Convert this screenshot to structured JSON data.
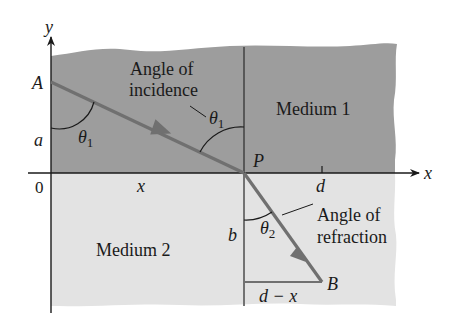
{
  "diagram": {
    "colors": {
      "medium1": "#9d9d9d",
      "medium2": "#e3e3e3",
      "ray": "#707070",
      "axis": "#1a1a1a",
      "normal": "#555555",
      "background": "#ffffff"
    },
    "axes": {
      "x_label": "x",
      "y_label": "y",
      "origin_label": "0"
    },
    "regions": {
      "medium1_label": "Medium 1",
      "medium2_label": "Medium 2"
    },
    "points": {
      "A": "A",
      "P": "P",
      "B": "B"
    },
    "lengths": {
      "a": "a",
      "b": "b",
      "x": "x",
      "d": "d",
      "d_minus_x": "d − x"
    },
    "angles": {
      "theta1_symbol": "θ",
      "theta1_sub": "1",
      "theta2_symbol": "θ",
      "theta2_sub": "2"
    },
    "annotations": {
      "incidence_line1": "Angle of",
      "incidence_line2": "incidence",
      "refraction_line1": "Angle of",
      "refraction_line2": "refraction"
    }
  }
}
